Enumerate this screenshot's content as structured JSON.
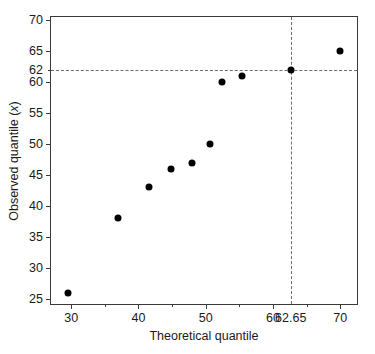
{
  "chart_data": {
    "type": "scatter",
    "title": "",
    "xlabel": "Theoretical quantile",
    "ylabel": "Observed quantile (x)",
    "xlim": [
      27,
      72.5
    ],
    "ylim": [
      24.2,
      70.5
    ],
    "grid": false,
    "legend": "none",
    "x": [
      29.5,
      37.0,
      41.5,
      44.9,
      47.9,
      50.6,
      52.4,
      55.4,
      62.65,
      70.0
    ],
    "y": [
      26,
      38,
      43,
      46,
      47,
      50,
      60,
      61,
      62,
      65
    ],
    "points": [
      {
        "x": 29.5,
        "y": 26
      },
      {
        "x": 37.0,
        "y": 38
      },
      {
        "x": 41.5,
        "y": 43
      },
      {
        "x": 44.9,
        "y": 46
      },
      {
        "x": 47.9,
        "y": 47
      },
      {
        "x": 50.6,
        "y": 50
      },
      {
        "x": 52.4,
        "y": 60
      },
      {
        "x": 55.4,
        "y": 61
      },
      {
        "x": 62.65,
        "y": 62
      },
      {
        "x": 70.0,
        "y": 65
      }
    ],
    "xticks_major": [
      30,
      40,
      50,
      60,
      70
    ],
    "xticks_major_labels": [
      "30",
      "40",
      "50",
      "60",
      "70"
    ],
    "xticks_minor": [
      35,
      45,
      55,
      65
    ],
    "yticks_major": [
      25,
      30,
      35,
      40,
      45,
      50,
      55,
      60,
      65,
      70
    ],
    "yticks_major_labels": [
      "25",
      "30",
      "35",
      "40",
      "45",
      "50",
      "55",
      "60",
      "65",
      "70"
    ],
    "yticks_extra": [
      62
    ],
    "yticks_extra_labels": [
      "62"
    ],
    "reference_lines": [
      {
        "orientation": "horizontal",
        "value": 62,
        "style": "dashed",
        "label": "62"
      },
      {
        "orientation": "vertical",
        "value": 62.65,
        "style": "dashed",
        "label": "62.65"
      }
    ],
    "annotations": [
      {
        "text": "62.65",
        "axis": "x",
        "value": 62.65
      },
      {
        "text": "62",
        "axis": "y",
        "value": 62
      }
    ],
    "colors": {
      "marker": "#000000",
      "axis": "#3a3a3a",
      "reference_line": "#6d6d6d",
      "background": "#ffffff",
      "text": "#1a1a1a"
    }
  },
  "axes": {
    "x_title": "Theoretical quantile",
    "y_title_prefix": "Observed quantile (",
    "y_title_var": "x",
    "y_title_suffix": ")"
  }
}
